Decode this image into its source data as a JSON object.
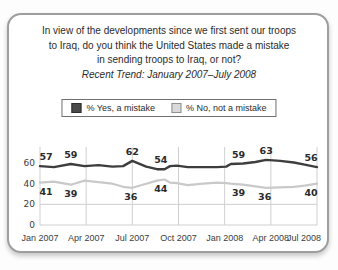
{
  "question": {
    "lines": [
      "In view of the developments since we first sent our troops",
      "to Iraq, do you think the United States made a mistake",
      "in sending troops to Iraq, or not?"
    ],
    "trend_note": "Recent Trend: January 2007–July 2008"
  },
  "legend": {
    "items": [
      {
        "label": "% Yes, a mistake",
        "swatch_color": "#4a4a4a",
        "swatch_border": "#2e2e2e"
      },
      {
        "label": "% No, not a mistake",
        "swatch_color": "#d9d9d9",
        "swatch_border": "#8f8f8f"
      }
    ]
  },
  "chart_data": {
    "type": "line",
    "x_axis": {
      "tick_labels": [
        "Jan 2007",
        "Apr 2007",
        "Jul 2007",
        "Oct 2007",
        "Jan 2008",
        "Apr 2008",
        "Jul 2008"
      ],
      "tick_months": [
        0,
        3,
        6,
        9,
        12,
        15,
        18
      ]
    },
    "y_axis": {
      "ticks": [
        0,
        20,
        40,
        60
      ],
      "range": [
        0,
        74
      ]
    },
    "gridlines": {
      "horizontal_values": [
        0,
        20
      ],
      "vertical_months": [
        0,
        3,
        6,
        9,
        12,
        15,
        18
      ],
      "color": "#cfcfcf"
    },
    "colors": {
      "tick_text": "#3c3c3c",
      "label_text": "#2b2b2b"
    },
    "series": [
      {
        "name": "% Yes, a mistake",
        "color": "#3d3d3d",
        "stroke_width": 2.4,
        "label_side": "above",
        "points": [
          [
            0,
            57
          ],
          [
            0.9,
            56
          ],
          [
            2,
            59
          ],
          [
            2.9,
            57
          ],
          [
            3.8,
            58
          ],
          [
            4.7,
            56.5
          ],
          [
            5.4,
            57
          ],
          [
            6,
            62
          ],
          [
            6.9,
            56.5
          ],
          [
            7.6,
            54
          ],
          [
            8.1,
            54
          ],
          [
            8.45,
            57
          ],
          [
            8.9,
            57.5
          ],
          [
            9.6,
            56
          ],
          [
            10.6,
            56
          ],
          [
            11.5,
            56
          ],
          [
            12.1,
            56.5
          ],
          [
            12.4,
            59
          ],
          [
            13.2,
            59.5
          ],
          [
            14,
            61
          ],
          [
            14.7,
            63
          ],
          [
            15.6,
            62
          ],
          [
            16.5,
            60.5
          ],
          [
            17.2,
            58.5
          ],
          [
            18,
            56
          ]
        ],
        "labels": [
          {
            "month": 0,
            "value": 57
          },
          {
            "month": 2,
            "value": 59
          },
          {
            "month": 6,
            "value": 62
          },
          {
            "month": 7.85,
            "value": 54
          },
          {
            "month": 12.9,
            "value": 59
          },
          {
            "month": 14.7,
            "value": 63
          },
          {
            "month": 18,
            "value": 56
          }
        ]
      },
      {
        "name": "% No, not a mistake",
        "color": "#c9c9c9",
        "stroke_width": 2.2,
        "label_side": "below",
        "points": [
          [
            0,
            41
          ],
          [
            0.9,
            42
          ],
          [
            2,
            39
          ],
          [
            2.9,
            43
          ],
          [
            3.8,
            41.5
          ],
          [
            4.7,
            40
          ],
          [
            5.4,
            37
          ],
          [
            6,
            36
          ],
          [
            6.9,
            40
          ],
          [
            7.6,
            43
          ],
          [
            8.1,
            44
          ],
          [
            8.45,
            41
          ],
          [
            8.9,
            40.5
          ],
          [
            9.6,
            38.5
          ],
          [
            10.6,
            40
          ],
          [
            11.5,
            41
          ],
          [
            12.1,
            40.5
          ],
          [
            12.4,
            40
          ],
          [
            13.2,
            39
          ],
          [
            14,
            37.5
          ],
          [
            14.7,
            36
          ],
          [
            15.6,
            36.5
          ],
          [
            16.5,
            37
          ],
          [
            17.2,
            38
          ],
          [
            18,
            40
          ]
        ],
        "labels": [
          {
            "month": 0,
            "value": 41
          },
          {
            "month": 2,
            "value": 39
          },
          {
            "month": 5.9,
            "value": 36
          },
          {
            "month": 7.85,
            "value": 44
          },
          {
            "month": 12.9,
            "value": 39
          },
          {
            "month": 14.6,
            "value": 36
          },
          {
            "month": 18,
            "value": 40
          }
        ]
      }
    ]
  }
}
